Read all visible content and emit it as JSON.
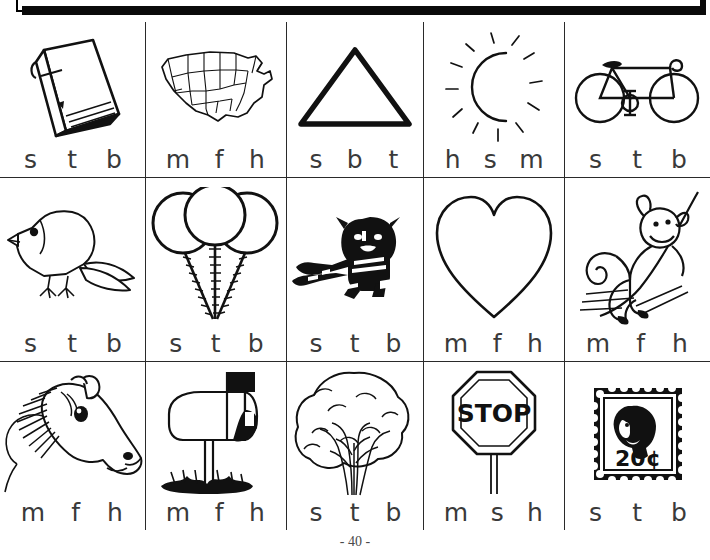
{
  "worksheet": {
    "page_number": "- 40 -",
    "rows": [
      {
        "cells": [
          {
            "picture": "book",
            "choices": [
              "s",
              "t",
              "b"
            ]
          },
          {
            "picture": "map-of-united-states",
            "choices": [
              "m",
              "f",
              "h"
            ]
          },
          {
            "picture": "triangle",
            "choices": [
              "s",
              "b",
              "t"
            ]
          },
          {
            "picture": "moon-with-rays",
            "choices": [
              "h",
              "s",
              "m"
            ]
          },
          {
            "picture": "bicycle",
            "choices": [
              "s",
              "t",
              "b"
            ]
          }
        ]
      },
      {
        "cells": [
          {
            "picture": "bird",
            "choices": [
              "s",
              "t",
              "b"
            ]
          },
          {
            "picture": "balloons",
            "choices": [
              "s",
              "t",
              "b"
            ]
          },
          {
            "picture": "tiger",
            "choices": [
              "s",
              "t",
              "b"
            ]
          },
          {
            "picture": "heart",
            "choices": [
              "m",
              "f",
              "h"
            ]
          },
          {
            "picture": "monkey",
            "choices": [
              "m",
              "f",
              "h"
            ]
          }
        ]
      },
      {
        "cells": [
          {
            "picture": "horse-head",
            "choices": [
              "m",
              "f",
              "h"
            ]
          },
          {
            "picture": "mailbox",
            "choices": [
              "m",
              "f",
              "h"
            ]
          },
          {
            "picture": "tree",
            "choices": [
              "s",
              "t",
              "b"
            ]
          },
          {
            "picture": "stop-sign",
            "choices": [
              "m",
              "s",
              "h"
            ],
            "sign_text": "STOP"
          },
          {
            "picture": "postage-stamp",
            "choices": [
              "s",
              "t",
              "b"
            ],
            "stamp_text": "20¢"
          }
        ]
      }
    ]
  },
  "colors": {
    "ink": "#1a1a1a",
    "rule": "#2a2a2a",
    "letter": "#3a3a3a",
    "paper": "#ffffff"
  }
}
